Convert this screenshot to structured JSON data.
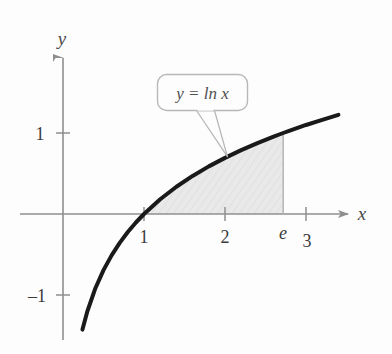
{
  "figure": {
    "background_color": "#fdfdfd",
    "curve_color": "#1a1a1a",
    "axis_color": "#8f8f8f",
    "shade_color": "#e8e8e8",
    "callout_border_color": "#b8b8b8"
  },
  "axes": {
    "x_axis_label": "x",
    "y_axis_label": "y",
    "origin_px": {
      "x": 63,
      "y": 214
    },
    "unit_px": 81,
    "x_ticks": [
      {
        "label": "1",
        "value": 1,
        "style": "upright",
        "has_tick_mark": true
      },
      {
        "label": "2",
        "value": 2,
        "style": "upright",
        "has_tick_mark": true
      },
      {
        "label": "e",
        "value": 2.71828,
        "style": "italic",
        "has_tick_mark": false
      },
      {
        "label": "3",
        "value": 3,
        "style": "upright",
        "has_tick_mark": true
      }
    ],
    "y_ticks": [
      {
        "label": "1",
        "value": 1,
        "style": "upright",
        "has_tick_mark": true
      },
      {
        "label": "–1",
        "value": -1,
        "style": "upright",
        "has_tick_mark": true
      }
    ]
  },
  "callout": {
    "text_lhs": "y",
    "text_equals": " = ",
    "text_fn": "ln",
    "text_arg": "x",
    "full_text": "y = ln x"
  },
  "chart_data": {
    "type": "line",
    "title": "",
    "xlabel": "x",
    "ylabel": "y",
    "xlim": [
      0,
      3.4
    ],
    "ylim": [
      -1.6,
      1.3
    ],
    "grid": false,
    "legend": "callout",
    "annotations": [
      {
        "text": "y = ln x",
        "type": "callout-box",
        "points_to_x": 2.03,
        "points_to_y": 0.708
      }
    ],
    "series": [
      {
        "name": "y = ln x",
        "function": "ln(x)",
        "x": [
          0.24,
          0.3,
          0.4,
          0.5,
          0.6,
          0.7,
          0.8,
          0.9,
          1.0,
          1.2,
          1.4,
          1.6,
          1.8,
          2.0,
          2.2,
          2.4,
          2.6,
          2.71828,
          2.8,
          3.0,
          3.2,
          3.4
        ],
        "y": [
          -1.427,
          -1.204,
          -0.916,
          -0.693,
          -0.511,
          -0.357,
          -0.223,
          -0.105,
          0.0,
          0.182,
          0.336,
          0.47,
          0.588,
          0.693,
          0.788,
          0.875,
          0.956,
          1.0,
          1.03,
          1.099,
          1.163,
          1.224
        ]
      }
    ],
    "shaded_region": {
      "label": "area under y = ln x",
      "x_start": 1,
      "x_end": 2.71828,
      "x_end_label": "e",
      "upper_bound": "ln(x)",
      "lower_bound": "0",
      "fill": "#e8e8e8"
    }
  }
}
